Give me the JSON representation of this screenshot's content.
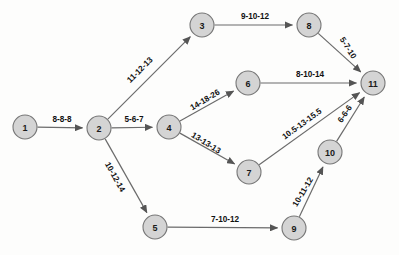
{
  "diagram": {
    "background_color": "#fdfdfc",
    "node_fill_color": "#d4d4d4",
    "node_stroke_color": "#777777",
    "edge_color": "#6b6b6b",
    "label_color": "#111111",
    "node_radius": 12,
    "nodes": [
      {
        "id": "1",
        "label": "1",
        "x": 25,
        "y": 127
      },
      {
        "id": "2",
        "label": "2",
        "x": 99,
        "y": 128
      },
      {
        "id": "3",
        "label": "3",
        "x": 202,
        "y": 25
      },
      {
        "id": "4",
        "label": "4",
        "x": 169,
        "y": 127
      },
      {
        "id": "5",
        "label": "5",
        "x": 155,
        "y": 227
      },
      {
        "id": "6",
        "label": "6",
        "x": 248,
        "y": 83
      },
      {
        "id": "7",
        "label": "7",
        "x": 249,
        "y": 172
      },
      {
        "id": "8",
        "label": "8",
        "x": 309,
        "y": 25
      },
      {
        "id": "9",
        "label": "9",
        "x": 294,
        "y": 228
      },
      {
        "id": "10",
        "label": "10",
        "x": 330,
        "y": 152
      },
      {
        "id": "11",
        "label": "11",
        "x": 373,
        "y": 83
      }
    ],
    "edges": [
      {
        "from": "1",
        "to": "2",
        "label": "8-8-8",
        "label_x": 62,
        "label_y": 119,
        "rotate": 0
      },
      {
        "from": "2",
        "to": "3",
        "label": "11-12-13",
        "label_x": 140,
        "label_y": 70,
        "rotate": -45
      },
      {
        "from": "2",
        "to": "4",
        "label": "5-6-7",
        "label_x": 134,
        "label_y": 119,
        "rotate": 0
      },
      {
        "from": "2",
        "to": "5",
        "label": "10-12-14",
        "label_x": 115,
        "label_y": 177,
        "rotate": 61
      },
      {
        "from": "3",
        "to": "8",
        "label": "9-10-12",
        "label_x": 255,
        "label_y": 16,
        "rotate": 0
      },
      {
        "from": "4",
        "to": "6",
        "label": "14-18-26",
        "label_x": 205,
        "label_y": 100,
        "rotate": -31
      },
      {
        "from": "4",
        "to": "7",
        "label": "13-13-13",
        "label_x": 206,
        "label_y": 143,
        "rotate": 32
      },
      {
        "from": "5",
        "to": "9",
        "label": "7-10-12",
        "label_x": 225,
        "label_y": 219,
        "rotate": 0
      },
      {
        "from": "6",
        "to": "11",
        "label": "8-10-14",
        "label_x": 310,
        "label_y": 74,
        "rotate": 0
      },
      {
        "from": "7",
        "to": "11",
        "label": "10.5-13-15.5",
        "label_x": 302,
        "label_y": 124,
        "rotate": -36
      },
      {
        "from": "8",
        "to": "11",
        "label": "5-7-10",
        "label_x": 348,
        "label_y": 48,
        "rotate": 58
      },
      {
        "from": "9",
        "to": "10",
        "label": "10-11-12",
        "label_x": 303,
        "label_y": 192,
        "rotate": -59
      },
      {
        "from": "10",
        "to": "11",
        "label": "6-6-6",
        "label_x": 345,
        "label_y": 114,
        "rotate": -56
      }
    ]
  }
}
